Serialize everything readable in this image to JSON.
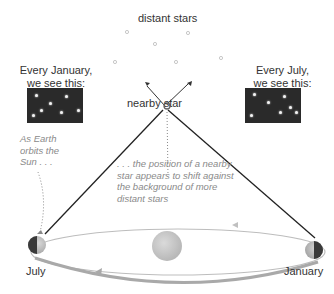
{
  "labels": {
    "distant_stars": "distant stars",
    "nearby_star": "nearby star",
    "january_view_line1": "Every January,",
    "january_view_line2": "we see this:",
    "july_view_line1": "Every July,",
    "july_view_line2": "we see this:",
    "july": "July",
    "january": "January"
  },
  "annotations": {
    "earth_orbit_line1": "As Earth",
    "earth_orbit_line2": "orbits the",
    "earth_orbit_line3": "Sun . . .",
    "shift_line1": ". . . the position of a nearby",
    "shift_line2": "star appears to shift against",
    "shift_line3": "the background of more",
    "shift_line4": "distant stars"
  },
  "colors": {
    "panel_bg": "#2a2a2a",
    "text": "#333333",
    "annotation": "#8a8a8a",
    "sun": "#c8c8c8",
    "orbit": "#b0b0b0",
    "sight_line": "#222222"
  }
}
